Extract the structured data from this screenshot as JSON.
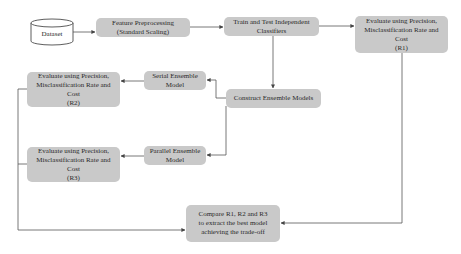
{
  "diagram": {
    "type": "flowchart",
    "colors": {
      "node_fill": "#c9c9c9",
      "edge": "#555555",
      "background": "#ffffff"
    },
    "nodes": {
      "dataset": {
        "shape": "cylinder",
        "lines": [
          "Dataset"
        ]
      },
      "preprocess": {
        "lines": [
          "Feature Preprocessing",
          "(Standard Scaling)"
        ]
      },
      "train": {
        "lines": [
          "Train and Test Independent",
          "Classifiers"
        ]
      },
      "eval_r1": {
        "lines": [
          "Evaluate using Precision,",
          "Misclassification Rate and",
          "Cost",
          "(R1)"
        ]
      },
      "eval_r2": {
        "lines": [
          "Evaluate using Precision,",
          "Misclassification Rate and",
          "Cost",
          "(R2)"
        ]
      },
      "serial": {
        "lines": [
          "Serial Ensemble",
          "Model"
        ]
      },
      "construct": {
        "lines": [
          "Construct Ensemble Models"
        ]
      },
      "eval_r3": {
        "lines": [
          "Evaluate using Precision,",
          "Misclassification Rate and",
          "Cost",
          "(R3)"
        ]
      },
      "parallel": {
        "lines": [
          "Parallel Ensemble",
          "Model"
        ]
      },
      "compare": {
        "lines": [
          "Compare R1, R2 and R3",
          "to extract the best model",
          "achieving the trade-off"
        ]
      }
    },
    "edges": [
      {
        "from": "dataset",
        "to": "preprocess"
      },
      {
        "from": "preprocess",
        "to": "train"
      },
      {
        "from": "train",
        "to": "eval_r1"
      },
      {
        "from": "train",
        "to": "construct"
      },
      {
        "from": "construct",
        "to": "serial"
      },
      {
        "from": "construct",
        "to": "parallel"
      },
      {
        "from": "serial",
        "to": "eval_r2"
      },
      {
        "from": "parallel",
        "to": "eval_r3"
      },
      {
        "from": "eval_r2",
        "to": "compare"
      },
      {
        "from": "eval_r3",
        "to": "compare"
      },
      {
        "from": "eval_r1",
        "to": "compare"
      }
    ]
  }
}
